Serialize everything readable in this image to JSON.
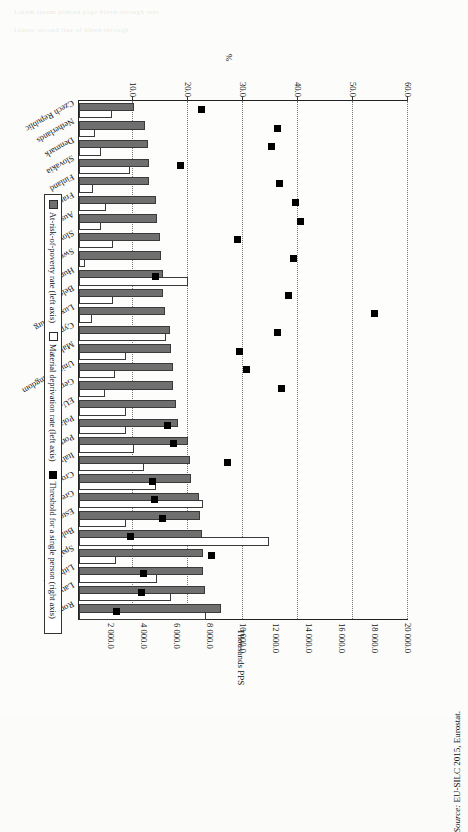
{
  "source": {
    "prefix": "Source:",
    "text": "EU-SILC 2015, Eurostat."
  },
  "legend": {
    "items": [
      {
        "label": "At-risk-of-poverty rate (left axis)",
        "swatch": "filled-gray-square"
      },
      {
        "label": "Material deprivation rate (left axis)",
        "swatch": "open-square"
      },
      {
        "label": "Threshold for a single person (right axis)",
        "swatch": "filled-black-square"
      }
    ]
  },
  "axes": {
    "left": {
      "title": "%",
      "ticks": [
        "60.0",
        "50.0",
        "40.0",
        "30.0",
        "20.0",
        "10.0"
      ],
      "min": 0,
      "max": 60
    },
    "right": {
      "title": "Thousands PPS",
      "ticks": [
        "20 000.0",
        "18 000.0",
        "16 000.0",
        "14 000.0",
        "12 000.0",
        "10 000.0",
        "8 000.0",
        "6 000.0",
        "4 000.0",
        "2 000.0"
      ],
      "min": 0,
      "max": 20000
    }
  },
  "chart_data": {
    "type": "bar",
    "title": "",
    "xlabel": "",
    "ylabel": "%",
    "y2label": "Thousands PPS",
    "ylim": [
      0,
      60
    ],
    "y2lim": [
      0,
      20000
    ],
    "grid": true,
    "legend_position": "bottom",
    "categories": [
      "Czech Republic",
      "Netherlands",
      "Denmark",
      "Slovakia",
      "Finland",
      "France",
      "Austria",
      "Slovenia",
      "Sweden",
      "Hungary",
      "Belgium",
      "Luxembourg",
      "Cyprus",
      "Malta",
      "United Kingdom",
      "Germany",
      "EU-28",
      "Poland",
      "Portugal",
      "Italy",
      "Croatia",
      "Greece",
      "Estonia",
      "Bulgaria",
      "Spain",
      "Lithuania",
      "Latvia",
      "Romania"
    ],
    "series": [
      {
        "name": "At-risk-of-poverty rate (left axis)",
        "axis": "left",
        "unit": "%",
        "values": [
          9.7,
          11.6,
          12.2,
          12.3,
          12.4,
          13.6,
          13.9,
          14.3,
          14.5,
          14.9,
          14.9,
          15.3,
          16.2,
          16.3,
          16.7,
          16.7,
          17.3,
          17.6,
          19.5,
          19.9,
          20.0,
          21.4,
          21.6,
          22.0,
          22.1,
          22.2,
          22.5,
          25.4
        ]
      },
      {
        "name": "Material deprivation rate (left axis)",
        "axis": "left",
        "unit": "%",
        "values": [
          5.6,
          2.5,
          3.7,
          9.0,
          2.2,
          4.5,
          3.6,
          5.8,
          0.7,
          19.4,
          5.8,
          2.0,
          15.4,
          8.1,
          6.1,
          4.4,
          8.1,
          8.1,
          9.6,
          11.5,
          13.7,
          22.2,
          8.1,
          34.2,
          6.4,
          13.9,
          16.4,
          22.7
        ]
      }
    ],
    "markers": {
      "name": "Threshold for a single person (right axis)",
      "axis": "right",
      "unit": "PPS",
      "values": [
        7450,
        12050,
        11650,
        6150,
        12150,
        13100,
        13450,
        9600,
        13000,
        4650,
        12700,
        17900,
        12050,
        9700,
        10150,
        12300,
        0,
        5350,
        5700,
        9000,
        4450,
        4550,
        5050,
        3100,
        8050,
        3900,
        3800,
        2250
      ]
    }
  },
  "icons": {
    "marker": "filled-square-icon",
    "bar_filled": "filled-bar-icon",
    "bar_open": "open-bar-icon"
  }
}
